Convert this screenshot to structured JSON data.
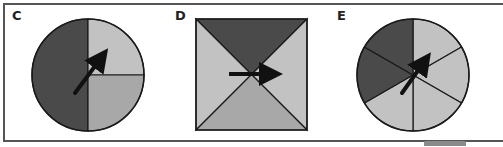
{
  "panels": [
    {
      "label": "C",
      "shape": "circle",
      "sectors": [
        {
          "fraction": "1/2",
          "position": "left",
          "shade": "dark"
        },
        {
          "fraction": "1/4",
          "position": "top-right",
          "shade": "light"
        },
        {
          "fraction": "1/4",
          "position": "bottom-right",
          "shade": "medium"
        }
      ],
      "arrow_direction": "up-right"
    },
    {
      "label": "D",
      "shape": "square",
      "sectors": [
        {
          "fraction": "1/4",
          "position": "top",
          "shade": "dark"
        },
        {
          "fraction": "1/4",
          "position": "left",
          "shade": "light"
        },
        {
          "fraction": "1/4",
          "position": "right",
          "shade": "light"
        },
        {
          "fraction": "1/4",
          "position": "bottom",
          "shade": "medium"
        }
      ],
      "arrow_direction": "right"
    },
    {
      "label": "E",
      "shape": "circle",
      "sectors": [
        {
          "fraction": "1/6",
          "position": "upper-left",
          "shade": "dark"
        },
        {
          "fraction": "1/6",
          "position": "left",
          "shade": "dark"
        },
        {
          "fraction": "1/6",
          "position": "lower-left",
          "shade": "light"
        },
        {
          "fraction": "1/6",
          "position": "lower-right",
          "shade": "light"
        },
        {
          "fraction": "1/6",
          "position": "right",
          "shade": "light"
        },
        {
          "fraction": "1/6",
          "position": "upper-right",
          "shade": "light"
        }
      ],
      "arrow_direction": "up-right"
    }
  ],
  "colors": {
    "dark": "#4a4a4a",
    "medium": "#a8a8a8",
    "light": "#c2c2c2",
    "stroke": "#1a1a1a",
    "arrow": "#111111"
  }
}
